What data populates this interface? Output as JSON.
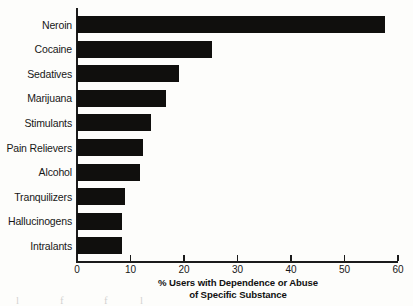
{
  "chart_data": {
    "type": "bar",
    "orientation": "horizontal",
    "title": "",
    "xlabel": "% Users with Dependence or Abuse of Specific Substance",
    "xlabel_lines": [
      "% Users with Dependence or Abuse",
      "of Specific Substance"
    ],
    "ylabel": "",
    "categories": [
      "Neroin",
      "Cocaine",
      "Sedatives",
      "Marijuana",
      "Stimulants",
      "Pain Relievers",
      "Alcohol",
      "Tranquilizers",
      "Hallucinogens",
      "Intralants"
    ],
    "values": [
      57.5,
      25.3,
      19.1,
      16.6,
      13.8,
      12.3,
      11.8,
      8.9,
      8.4,
      8.4
    ],
    "xlim": [
      0,
      60
    ],
    "xticks": [
      0,
      10,
      20,
      30,
      40,
      50,
      60
    ],
    "xtick_labels": [
      "0",
      "10",
      "20",
      "30",
      "40",
      "50",
      "60"
    ],
    "grid": false,
    "legend": false,
    "bar_color": "#100f0d",
    "axis_color": "#1b1b1b",
    "background_color": "#fdfdfb"
  },
  "artifacts": {
    "bleed_text": [
      "l",
      "f",
      "f",
      "l"
    ]
  }
}
